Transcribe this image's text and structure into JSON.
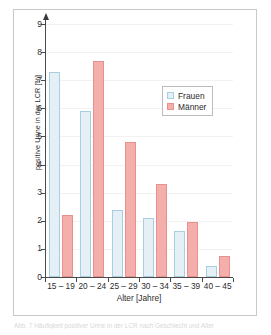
{
  "chart_data": {
    "type": "bar",
    "title": "",
    "categories": [
      "15 – 19",
      "20 – 24",
      "25 – 29",
      "30 – 34",
      "35 – 39",
      "40 – 45"
    ],
    "series": [
      {
        "name": "Frauen",
        "color": "#e4f0f6",
        "border": "#a8cfe0",
        "values": [
          7.3,
          5.9,
          2.4,
          2.1,
          1.65,
          0.4
        ]
      },
      {
        "name": "Männer",
        "color": "#f4aeab",
        "border": "#e8908c",
        "values": [
          2.2,
          7.7,
          4.8,
          3.3,
          1.95,
          0.75
        ]
      }
    ],
    "xlabel": "Alter [Jahre]",
    "ylabel": "positive Urine in der LCR [%]",
    "ylim": [
      0,
      9
    ],
    "ytick_labels": [
      "0",
      "1",
      "2",
      "3",
      "4",
      "5",
      "6",
      "7",
      "8",
      "9"
    ],
    "ytick_values": [
      0,
      1,
      2,
      3,
      4,
      5,
      6,
      7,
      8,
      9
    ],
    "grid": true,
    "legend_position": "upper-right"
  },
  "legend": {
    "items": [
      {
        "label": "Frauen"
      },
      {
        "label": "Männer"
      }
    ]
  },
  "caption": {
    "text": "Abb. 7  Häufigkeit positiver Urine in der LCR nach Geschlecht und Alter"
  }
}
